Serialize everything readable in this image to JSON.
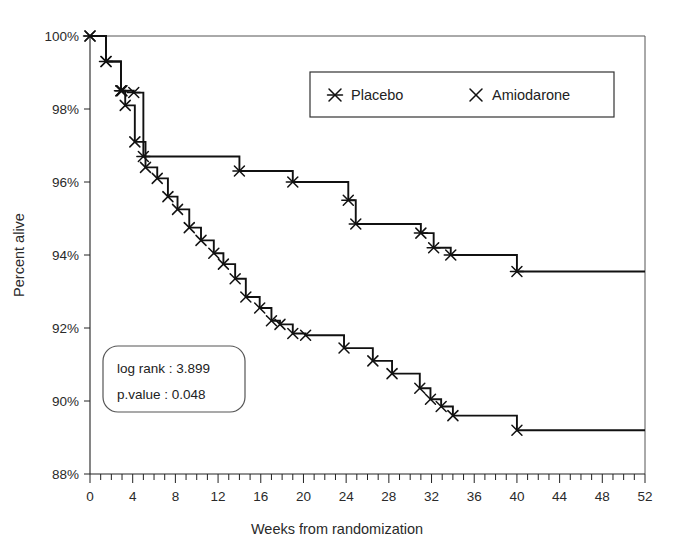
{
  "chart_data": {
    "type": "line",
    "title": "",
    "subtitle": "",
    "xlabel": "Weeks from randomization",
    "ylabel": "Percent alive",
    "xlim": [
      0,
      52
    ],
    "ylim": [
      88,
      100
    ],
    "grid": false,
    "legend_position": "top-right",
    "x_ticks": [
      0,
      4,
      8,
      12,
      16,
      20,
      24,
      28,
      32,
      36,
      40,
      44,
      48,
      52
    ],
    "x_tick_labels": [
      "0",
      "4",
      "8",
      "12",
      "16",
      "20",
      "24",
      "28",
      "32",
      "36",
      "40",
      "44",
      "48",
      "52"
    ],
    "x_minor_tick_step": 1,
    "y_ticks": [
      88,
      90,
      92,
      94,
      96,
      98,
      100
    ],
    "y_tick_labels": [
      "88%",
      "90%",
      "92%",
      "94%",
      "96%",
      "98%",
      "100%"
    ],
    "curve_style": "step-post",
    "series": [
      {
        "name": "Placebo",
        "marker": "x-with-horizontal-bar",
        "censor_marks": true,
        "x": [
          0,
          1.5,
          2.9,
          3.0,
          4.1,
          5.0,
          14.0,
          19.0,
          24.2,
          24.9,
          31.0,
          32.2,
          33.8,
          40.0,
          52.0
        ],
        "y": [
          100.0,
          99.3,
          98.5,
          98.5,
          98.45,
          96.7,
          96.3,
          96.0,
          95.5,
          94.85,
          94.6,
          94.2,
          94.0,
          93.55,
          93.55
        ]
      },
      {
        "name": "Amiodarone",
        "marker": "x",
        "censor_marks": true,
        "x": [
          0,
          1.5,
          2.9,
          3.3,
          4.2,
          5.2,
          6.3,
          7.3,
          8.2,
          9.3,
          10.4,
          11.6,
          12.5,
          13.6,
          14.6,
          15.9,
          17.0,
          17.8,
          19.0,
          20.2,
          23.8,
          26.5,
          28.3,
          30.9,
          31.9,
          32.9,
          34.0,
          40.0,
          52.0
        ],
        "y": [
          100.0,
          99.3,
          98.5,
          98.1,
          97.1,
          96.4,
          96.1,
          95.6,
          95.25,
          94.75,
          94.4,
          94.05,
          93.75,
          93.35,
          92.85,
          92.55,
          92.2,
          92.1,
          91.85,
          91.8,
          91.45,
          91.1,
          90.75,
          90.35,
          90.05,
          89.85,
          89.6,
          89.2,
          89.2
        ]
      }
    ]
  },
  "legend": {
    "entries": [
      {
        "label": "Placebo",
        "marker": "x-with-horizontal-bar"
      },
      {
        "label": "Amiodarone",
        "marker": "x"
      }
    ]
  },
  "stats_box": {
    "lines": [
      {
        "label": "log rank",
        "separator": " : ",
        "value": "3.899",
        "text": "log rank : 3.899"
      },
      {
        "label": "p.value",
        "separator": " : ",
        "value": "0.048",
        "text": "p.value : 0.048"
      }
    ]
  },
  "axes": {
    "x_title": "Weeks from randomization",
    "y_title": "Percent alive"
  },
  "colors": {
    "curve": "#111111",
    "axis": "#222222",
    "background": "#ffffff",
    "text": "#2a2a2a"
  }
}
